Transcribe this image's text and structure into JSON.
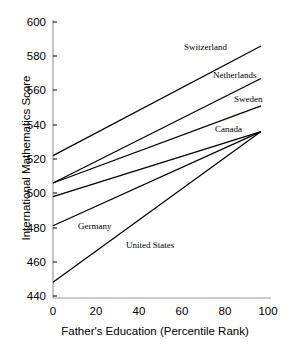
{
  "chart_data": {
    "type": "line",
    "title": "",
    "xlabel": "Father's Education (Percentile Rank)",
    "ylabel": "International Mathematics Score",
    "xlim": [
      0,
      100
    ],
    "ylim": [
      440,
      600
    ],
    "xticks": [
      "0",
      "20",
      "40",
      "60",
      "80",
      "100"
    ],
    "yticks": [
      "600",
      "580",
      "560",
      "540",
      "520",
      "500",
      "480",
      "460",
      "440"
    ],
    "grid": false,
    "legend_position": "inline-annotations",
    "x": [
      0,
      100
    ],
    "series": [
      {
        "name": "Switzerland",
        "values": [
          522,
          586
        ]
      },
      {
        "name": "Netherlands",
        "values": [
          506,
          567
        ]
      },
      {
        "name": "Sweden",
        "values": [
          506,
          551
        ]
      },
      {
        "name": "Canada",
        "values": [
          498,
          536
        ]
      },
      {
        "name": "Germany",
        "values": [
          481,
          536
        ]
      },
      {
        "name": "United States",
        "values": [
          448,
          536
        ]
      }
    ],
    "annotations": [
      {
        "text": "Switzerland",
        "x": 56,
        "y": 580
      },
      {
        "text": "Netherlands",
        "x": 70,
        "y": 565
      },
      {
        "text": "Sweden",
        "x": 82,
        "y": 552
      },
      {
        "text": "Canada",
        "x": 70,
        "y": 537
      },
      {
        "text": "Germany",
        "x": 16,
        "y": 480
      },
      {
        "text": "United States",
        "x": 36,
        "y": 470
      }
    ]
  },
  "axis": {
    "y_title": "International Mathematics Score",
    "x_title": "Father's Education (Percentile Rank)",
    "y_ticks": [
      "600",
      "580",
      "560",
      "540",
      "520",
      "500",
      "480",
      "460",
      "440"
    ],
    "x_ticks": [
      "0",
      "20",
      "40",
      "60",
      "80",
      "100"
    ]
  },
  "labels": {
    "switzerland": "Switzerland",
    "netherlands": "Netherlands",
    "sweden": "Sweden",
    "canada": "Canada",
    "germany": "Germany",
    "united_states": "United States"
  },
  "colors": {
    "line": "#000000",
    "spine": "#9a9a9a",
    "background": "#ffffff"
  }
}
